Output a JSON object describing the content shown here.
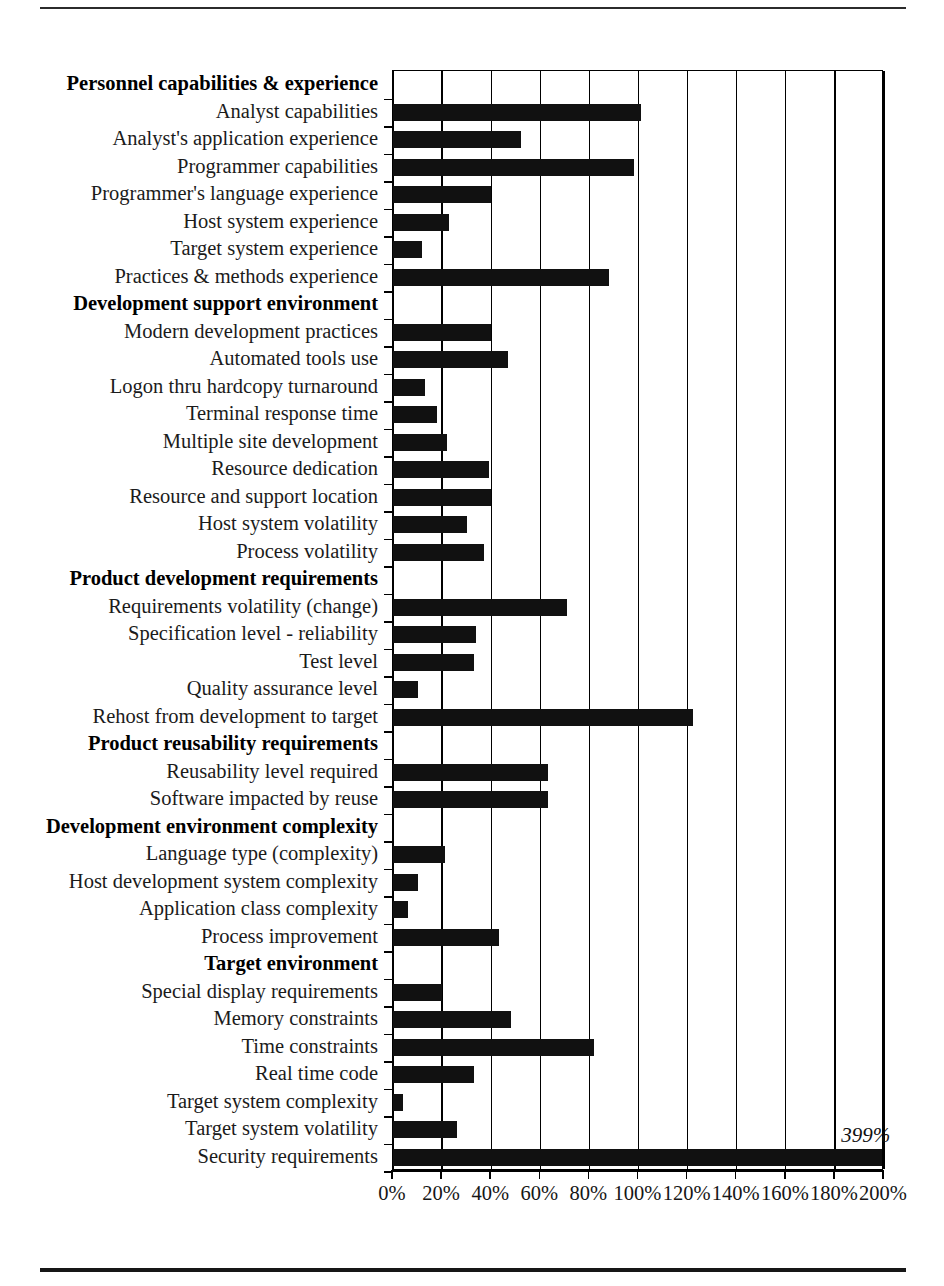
{
  "chart_data": {
    "type": "bar",
    "orientation": "horizontal",
    "title": "",
    "xlabel": "",
    "ylabel": "",
    "xlim": [
      0,
      200
    ],
    "xticks": [
      0,
      20,
      40,
      60,
      80,
      100,
      120,
      140,
      160,
      180,
      200
    ],
    "xtick_labels": [
      "0%",
      "20%",
      "40%",
      "60%",
      "80%",
      "100%",
      "120%",
      "140%",
      "160%",
      "180%",
      "200%"
    ],
    "grid": true,
    "legend": null,
    "units": "percent",
    "groups": [
      {
        "header": "Personnel capabilities & experience",
        "items": [
          {
            "label": "Analyst capabilities",
            "value": 101
          },
          {
            "label": "Analyst's application experience",
            "value": 52
          },
          {
            "label": "Programmer capabilities",
            "value": 98
          },
          {
            "label": "Programmer's language experience",
            "value": 40
          },
          {
            "label": "Host system experience",
            "value": 23
          },
          {
            "label": "Target system experience",
            "value": 12
          },
          {
            "label": "Practices & methods experience",
            "value": 88
          }
        ]
      },
      {
        "header": "Development support environment",
        "items": [
          {
            "label": "Modern development practices",
            "value": 40
          },
          {
            "label": "Automated tools use",
            "value": 47
          },
          {
            "label": "Logon thru hardcopy turnaround",
            "value": 13
          },
          {
            "label": "Terminal response time",
            "value": 18
          },
          {
            "label": "Multiple site development",
            "value": 22
          },
          {
            "label": "Resource dedication",
            "value": 39
          },
          {
            "label": "Resource and support location",
            "value": 40
          },
          {
            "label": "Host system volatility",
            "value": 30
          },
          {
            "label": "Process volatility",
            "value": 37
          }
        ]
      },
      {
        "header": "Product development requirements",
        "items": [
          {
            "label": "Requirements volatility (change)",
            "value": 71
          },
          {
            "label": "Specification level - reliability",
            "value": 34
          },
          {
            "label": "Test level",
            "value": 33
          },
          {
            "label": "Quality assurance level",
            "value": 10
          },
          {
            "label": "Rehost from development to target",
            "value": 122
          }
        ]
      },
      {
        "header": "Product reusability requirements",
        "items": [
          {
            "label": "Reusability level required",
            "value": 63
          },
          {
            "label": "Software impacted by reuse",
            "value": 63
          }
        ]
      },
      {
        "header": "Development environment complexity",
        "items": [
          {
            "label": "Language type (complexity)",
            "value": 21
          },
          {
            "label": "Host development system complexity",
            "value": 10
          },
          {
            "label": "Application class complexity",
            "value": 6
          },
          {
            "label": "Process improvement",
            "value": 43
          }
        ]
      },
      {
        "header": "Target environment",
        "items": [
          {
            "label": "Special display requirements",
            "value": 20
          },
          {
            "label": "Memory constraints",
            "value": 48
          },
          {
            "label": "Time constraints",
            "value": 82
          },
          {
            "label": "Real time code",
            "value": 33
          },
          {
            "label": "Target system complexity",
            "value": 4
          },
          {
            "label": "Target system volatility",
            "value": 26
          },
          {
            "label": "Security requirements",
            "value": 399,
            "clipped": true,
            "annotation": "399%"
          }
        ]
      }
    ]
  },
  "colors": {
    "bar": "#111111",
    "grid": "#000000",
    "text": "#1b1b1b",
    "background": "#ffffff"
  }
}
